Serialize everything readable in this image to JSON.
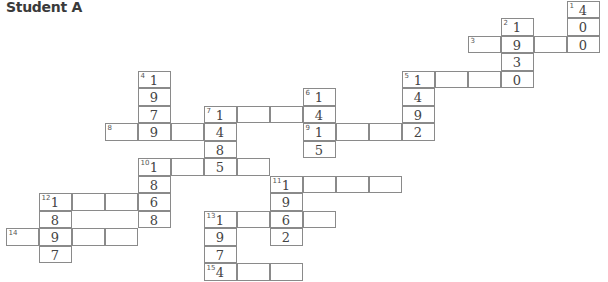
{
  "title": "Student A",
  "grid": {
    "origin_x": 6,
    "origin_y": 1,
    "cell_w": 33,
    "cell_h": 17.5,
    "cells": [
      {
        "r": 0,
        "c": 17,
        "n": "1",
        "v": "4"
      },
      {
        "r": 1,
        "c": 17,
        "n": "",
        "v": "0"
      },
      {
        "r": 2,
        "c": 17,
        "n": "",
        "v": "0"
      },
      {
        "r": 1,
        "c": 15,
        "n": "2",
        "v": "1"
      },
      {
        "r": 2,
        "c": 14,
        "n": "3",
        "v": ""
      },
      {
        "r": 2,
        "c": 15,
        "n": "",
        "v": "9"
      },
      {
        "r": 2,
        "c": 16,
        "n": "",
        "v": ""
      },
      {
        "r": 3,
        "c": 15,
        "n": "",
        "v": "3"
      },
      {
        "r": 4,
        "c": 15,
        "n": "",
        "v": "0"
      },
      {
        "r": 4,
        "c": 12,
        "n": "5",
        "v": "1"
      },
      {
        "r": 4,
        "c": 13,
        "n": "",
        "v": ""
      },
      {
        "r": 4,
        "c": 14,
        "n": "",
        "v": ""
      },
      {
        "r": 5,
        "c": 12,
        "n": "",
        "v": "4"
      },
      {
        "r": 6,
        "c": 12,
        "n": "",
        "v": "9"
      },
      {
        "r": 7,
        "c": 12,
        "n": "",
        "v": "2"
      },
      {
        "r": 4,
        "c": 4,
        "n": "4",
        "v": "1"
      },
      {
        "r": 5,
        "c": 4,
        "n": "",
        "v": "9"
      },
      {
        "r": 6,
        "c": 4,
        "n": "",
        "v": "7"
      },
      {
        "r": 7,
        "c": 4,
        "n": "",
        "v": "9"
      },
      {
        "r": 7,
        "c": 3,
        "n": "8",
        "v": ""
      },
      {
        "r": 7,
        "c": 5,
        "n": "",
        "v": ""
      },
      {
        "r": 5,
        "c": 9,
        "n": "6",
        "v": "1"
      },
      {
        "r": 6,
        "c": 9,
        "n": "",
        "v": "4"
      },
      {
        "r": 7,
        "c": 9,
        "n": "9",
        "v": "1"
      },
      {
        "r": 8,
        "c": 9,
        "n": "",
        "v": "5"
      },
      {
        "r": 7,
        "c": 10,
        "n": "",
        "v": ""
      },
      {
        "r": 7,
        "c": 11,
        "n": "",
        "v": ""
      },
      {
        "r": 6,
        "c": 6,
        "n": "7",
        "v": "1"
      },
      {
        "r": 6,
        "c": 7,
        "n": "",
        "v": ""
      },
      {
        "r": 6,
        "c": 8,
        "n": "",
        "v": ""
      },
      {
        "r": 7,
        "c": 6,
        "n": "",
        "v": "4"
      },
      {
        "r": 8,
        "c": 6,
        "n": "",
        "v": "8"
      },
      {
        "r": 9,
        "c": 6,
        "n": "",
        "v": "5"
      },
      {
        "r": 9,
        "c": 4,
        "n": "10",
        "v": "1"
      },
      {
        "r": 9,
        "c": 5,
        "n": "",
        "v": ""
      },
      {
        "r": 9,
        "c": 7,
        "n": "",
        "v": ""
      },
      {
        "r": 10,
        "c": 4,
        "n": "",
        "v": "8"
      },
      {
        "r": 11,
        "c": 4,
        "n": "",
        "v": "6"
      },
      {
        "r": 12,
        "c": 4,
        "n": "",
        "v": "8"
      },
      {
        "r": 10,
        "c": 8,
        "n": "11",
        "v": "1"
      },
      {
        "r": 10,
        "c": 9,
        "n": "",
        "v": ""
      },
      {
        "r": 10,
        "c": 10,
        "n": "",
        "v": ""
      },
      {
        "r": 10,
        "c": 11,
        "n": "",
        "v": ""
      },
      {
        "r": 11,
        "c": 8,
        "n": "",
        "v": "9"
      },
      {
        "r": 12,
        "c": 8,
        "n": "",
        "v": "6"
      },
      {
        "r": 13,
        "c": 8,
        "n": "",
        "v": "2"
      },
      {
        "r": 12,
        "c": 9,
        "n": "",
        "v": ""
      },
      {
        "r": 11,
        "c": 1,
        "n": "12",
        "v": "1"
      },
      {
        "r": 11,
        "c": 2,
        "n": "",
        "v": ""
      },
      {
        "r": 11,
        "c": 3,
        "n": "",
        "v": ""
      },
      {
        "r": 12,
        "c": 1,
        "n": "",
        "v": "8"
      },
      {
        "r": 13,
        "c": 1,
        "n": "",
        "v": "9"
      },
      {
        "r": 14,
        "c": 1,
        "n": "",
        "v": "7"
      },
      {
        "r": 13,
        "c": 0,
        "n": "14",
        "v": ""
      },
      {
        "r": 13,
        "c": 2,
        "n": "",
        "v": ""
      },
      {
        "r": 13,
        "c": 3,
        "n": "",
        "v": ""
      },
      {
        "r": 12,
        "c": 6,
        "n": "13",
        "v": "1"
      },
      {
        "r": 12,
        "c": 7,
        "n": "",
        "v": ""
      },
      {
        "r": 13,
        "c": 6,
        "n": "",
        "v": "9"
      },
      {
        "r": 14,
        "c": 6,
        "n": "",
        "v": "7"
      },
      {
        "r": 15,
        "c": 6,
        "n": "15",
        "v": "4"
      },
      {
        "r": 15,
        "c": 7,
        "n": "",
        "v": ""
      },
      {
        "r": 15,
        "c": 8,
        "n": "",
        "v": ""
      }
    ]
  }
}
